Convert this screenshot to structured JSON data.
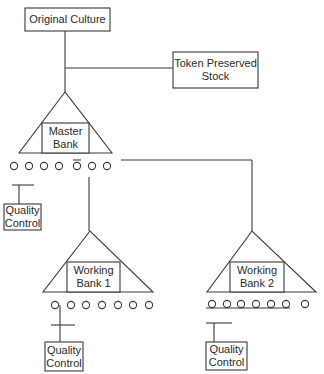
{
  "diagram": {
    "type": "cell-banking-hierarchy",
    "nodes": {
      "original_culture": {
        "label": "Original Culture"
      },
      "token_stock": {
        "label_line1": "Token Preserved",
        "label_line2": "Stock"
      },
      "master_bank": {
        "label_line1": "Master",
        "label_line2": "Bank",
        "vial_count": 7
      },
      "master_qc": {
        "label_line1": "Quality",
        "label_line2": "Control"
      },
      "working_bank_1": {
        "label_line1": "Working",
        "label_line2": "Bank 1",
        "vial_count": 7
      },
      "working_bank_1_qc": {
        "label_line1": "Quality",
        "label_line2": "Control"
      },
      "working_bank_2": {
        "label_line1": "Working",
        "label_line2": "Bank 2",
        "vial_count": 7
      },
      "working_bank_2_qc": {
        "label_line1": "Quality",
        "label_line2": "Control"
      }
    },
    "edges": [
      [
        "original_culture",
        "master_bank"
      ],
      [
        "original_culture",
        "token_stock"
      ],
      [
        "master_bank",
        "master_qc"
      ],
      [
        "master_bank",
        "working_bank_1"
      ],
      [
        "master_bank",
        "working_bank_2"
      ],
      [
        "working_bank_1",
        "working_bank_1_qc"
      ],
      [
        "working_bank_2",
        "working_bank_2_qc"
      ]
    ],
    "colors": {
      "line": "#3a3a3a",
      "text": "#2a2a2a",
      "background": "#ffffff"
    }
  }
}
